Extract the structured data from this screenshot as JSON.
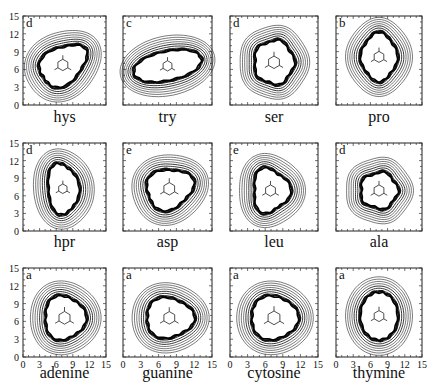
{
  "figure": {
    "axis_ticks": [
      "0",
      "3",
      "6",
      "9",
      "12",
      "15"
    ],
    "axis_range": [
      0,
      15
    ],
    "rows": [
      [
        {
          "name": "hys",
          "letter": "d",
          "shape": "pear-diag"
        },
        {
          "name": "try",
          "letter": "c",
          "shape": "wide"
        },
        {
          "name": "ser",
          "letter": "d",
          "shape": "round"
        },
        {
          "name": "pro",
          "letter": "b",
          "shape": "tall"
        }
      ],
      [
        {
          "name": "hpr",
          "letter": "d",
          "shape": "tall-left"
        },
        {
          "name": "asp",
          "letter": "e",
          "shape": "kidney"
        },
        {
          "name": "leu",
          "letter": "e",
          "shape": "trefoil"
        },
        {
          "name": "ala",
          "letter": "d",
          "shape": "round-small"
        }
      ],
      [
        {
          "name": "adenine",
          "letter": "a",
          "shape": "tri"
        },
        {
          "name": "guanine",
          "letter": "a",
          "shape": "tri-wide"
        },
        {
          "name": "cytosine",
          "letter": "a",
          "shape": "tri-round"
        },
        {
          "name": "thymine",
          "letter": "a",
          "shape": "tall-ring"
        }
      ]
    ]
  }
}
